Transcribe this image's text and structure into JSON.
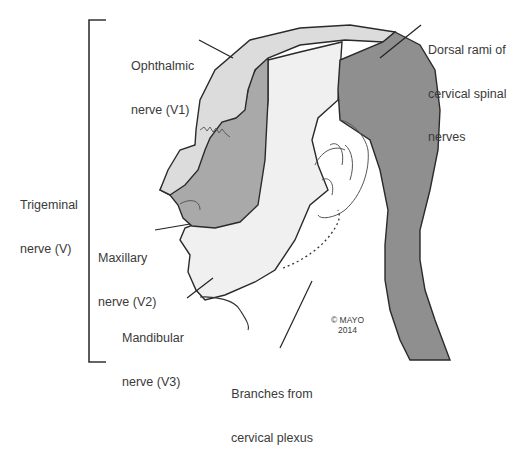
{
  "diagram": {
    "colors": {
      "ophthalmic_v1": "#dcdcdc",
      "maxillary_v2": "#a9a9a9",
      "mandibular_v3": "#f0f0f0",
      "dorsal_rami": "#8f8f8f",
      "cervical_plexus": "#ffffff",
      "outline": "#2a2a2a"
    },
    "bracket_label": {
      "line1": "Trigeminal",
      "line2": "nerve (V)"
    },
    "labels": {
      "ophthalmic": {
        "line1": "Ophthalmic",
        "line2": "nerve (V1)"
      },
      "maxillary": {
        "line1": "Maxillary",
        "line2": "nerve (V2)"
      },
      "mandibular": {
        "line1": "Mandibular",
        "line2": "nerve (V3)"
      },
      "dorsal_rami": {
        "line1": "Dorsal rami of",
        "line2": "cervical spinal",
        "line3": "nerves"
      },
      "cervical_plexus": {
        "line1": "Branches from",
        "line2": "cervical plexus"
      }
    },
    "copyright": {
      "line1": "© MAYO",
      "line2": "2014"
    }
  }
}
